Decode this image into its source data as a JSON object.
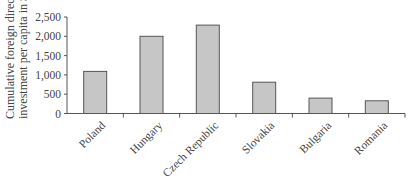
{
  "chart_data": {
    "type": "bar",
    "title": "",
    "xlabel": "",
    "ylabel": "Cumulative foreign direct investment per capita in $",
    "ylabel_lines": [
      "Cumulative foreign direct",
      "investment per capita in $"
    ],
    "categories": [
      "Poland",
      "Hungary",
      "Czech Republic",
      "Slovakia",
      "Bulgaria",
      "Romania"
    ],
    "values": [
      1090,
      2000,
      2290,
      810,
      400,
      330
    ],
    "ylim": [
      0,
      2500
    ],
    "yticks": [
      0,
      500,
      1000,
      1500,
      2000,
      2500
    ],
    "ytick_labels": [
      "0",
      "500",
      "1,000",
      "1,500",
      "2,000",
      "2,500"
    ],
    "grid": false,
    "legend": null,
    "x_label_rotation": -45,
    "colors": {
      "bar_fill": "#c6c6c6",
      "bar_stroke": "#555555",
      "axis": "#555555"
    }
  }
}
